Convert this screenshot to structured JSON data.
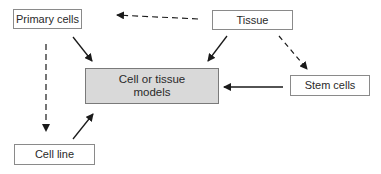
{
  "diagram": {
    "nodes": [
      {
        "id": "primary_cells",
        "label": "Primary cells"
      },
      {
        "id": "tissue",
        "label": "Tissue"
      },
      {
        "id": "stem_cells",
        "label": "Stem cells"
      },
      {
        "id": "models",
        "label_line1": "Cell or tissue",
        "label_line2": "models"
      },
      {
        "id": "cell_line",
        "label": "Cell line"
      }
    ],
    "edges": [
      {
        "from": "tissue",
        "to": "primary_cells",
        "style": "dashed"
      },
      {
        "from": "tissue",
        "to": "stem_cells",
        "style": "dashed"
      },
      {
        "from": "primary_cells",
        "to": "cell_line",
        "style": "dashed"
      },
      {
        "from": "primary_cells",
        "to": "models",
        "style": "solid"
      },
      {
        "from": "tissue",
        "to": "models",
        "style": "solid"
      },
      {
        "from": "stem_cells",
        "to": "models",
        "style": "solid"
      },
      {
        "from": "cell_line",
        "to": "models",
        "style": "solid"
      }
    ],
    "colors": {
      "center_fill": "#d9d9d9",
      "border": "#8a8a8a",
      "arrow": "#1a1a1a"
    }
  }
}
